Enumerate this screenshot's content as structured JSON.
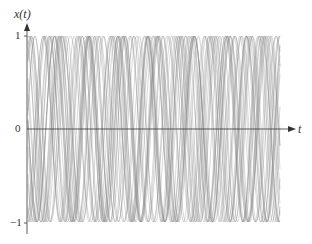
{
  "chart_data": {
    "type": "line",
    "title": "",
    "xlabel": "t",
    "ylabel": "x(t)",
    "ytick_labels": [
      "1",
      "0",
      "−1"
    ],
    "yticks": [
      1,
      0,
      -1
    ],
    "ylim": [
      -1,
      1
    ],
    "grid": false,
    "legend": null,
    "series_style": {
      "color": "#8a8a8a",
      "amplitude": 1,
      "count": 24
    }
  },
  "axes": {
    "y_label": "x(t)",
    "x_label": "t",
    "tick_1": "1",
    "tick_0": "0",
    "tick_neg1": "−1"
  }
}
